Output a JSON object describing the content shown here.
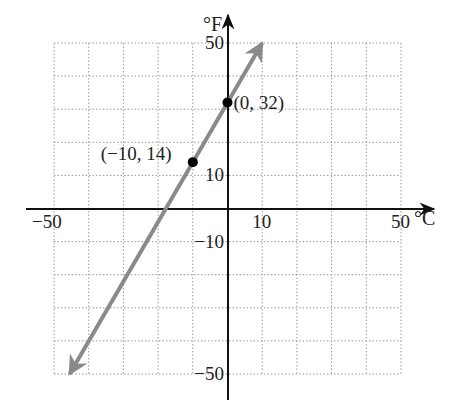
{
  "chart_data": {
    "type": "line",
    "title": "",
    "xlabel": "°C",
    "ylabel": "°F",
    "xlim": [
      -50,
      50
    ],
    "ylim": [
      -50,
      50
    ],
    "grid": true,
    "grid_step": 10,
    "x_tick_labels": [
      {
        "value": -50,
        "label": "−50"
      },
      {
        "value": 10,
        "label": "10"
      },
      {
        "value": 50,
        "label": "50"
      }
    ],
    "y_tick_labels": [
      {
        "value": 50,
        "label": "50"
      },
      {
        "value": 10,
        "label": "10"
      },
      {
        "value": -10,
        "label": "−10"
      },
      {
        "value": -50,
        "label": "−50"
      }
    ],
    "series": [
      {
        "name": "F = 1.8C + 32",
        "color": "#8a8a8a",
        "x": [
          -45.5,
          10
        ],
        "y": [
          -50,
          50
        ],
        "arrows_both_ends": true
      }
    ],
    "points": [
      {
        "x": 0,
        "y": 32,
        "label": "(0, 32)"
      },
      {
        "x": -10,
        "y": 14,
        "label": "(−10, 14)"
      }
    ]
  }
}
